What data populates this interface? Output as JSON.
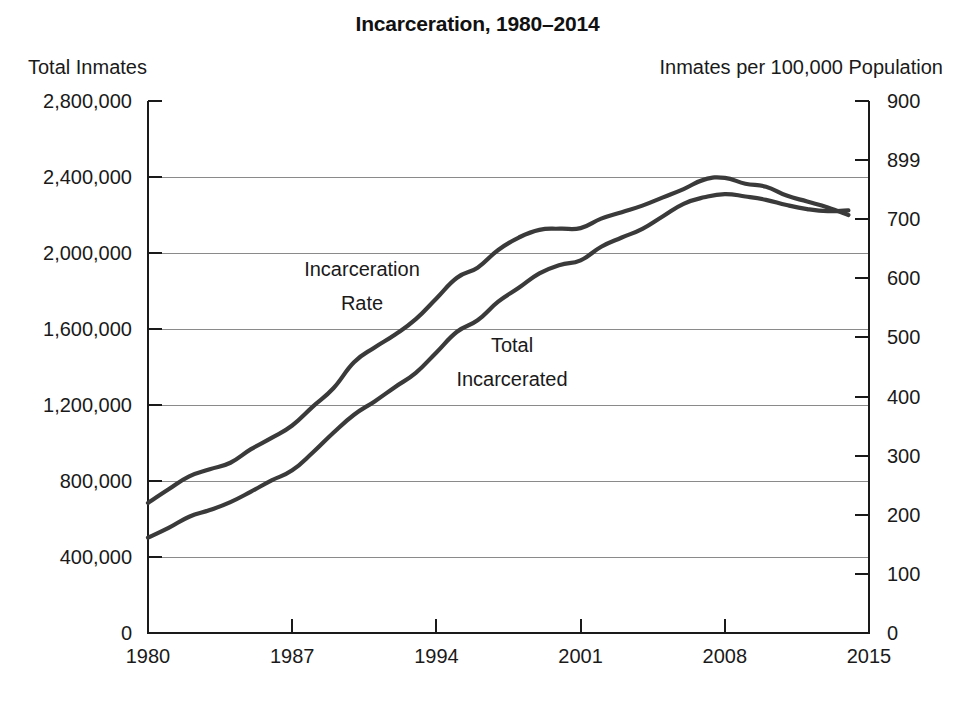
{
  "chart_data": {
    "type": "line",
    "title": "Incarceration, 1980–2014",
    "left_axis_title": "Total Inmates",
    "right_axis_title": "Inmates per 100,000 Population",
    "xlabel": "",
    "grid": true,
    "legend_position": "inline-annotation",
    "x": [
      1980,
      1981,
      1982,
      1983,
      1984,
      1985,
      1986,
      1987,
      1988,
      1989,
      1990,
      1991,
      1992,
      1993,
      1994,
      1995,
      1996,
      1997,
      1998,
      1999,
      2000,
      2001,
      2002,
      2003,
      2004,
      2005,
      2006,
      2007,
      2008,
      2009,
      2010,
      2011,
      2012,
      2013,
      2014
    ],
    "xlim": [
      1980,
      2015
    ],
    "x_tick_labels": [
      "1980",
      "1987",
      "1994",
      "2001",
      "2008",
      "2015"
    ],
    "x_ticks": [
      1980,
      1987,
      1994,
      2001,
      2008,
      2015
    ],
    "left_ylim": [
      0,
      2800000
    ],
    "left_y_ticks": [
      0,
      400000,
      800000,
      1200000,
      1600000,
      2000000,
      2400000,
      2800000
    ],
    "left_y_tick_labels": [
      "0",
      "400,000",
      "800,000",
      "1,200,000",
      "1,600,000",
      "2,000,000",
      "2,400,000",
      "2,800,000"
    ],
    "right_ylim": [
      0,
      900
    ],
    "right_y_ticks": [
      0,
      100,
      200,
      300,
      400,
      500,
      600,
      700,
      800,
      900
    ],
    "right_y_tick_labels": [
      "0",
      "100",
      "200",
      "300",
      "400",
      "500",
      "600",
      "700",
      "899",
      "900"
    ],
    "series": [
      {
        "name": "Incarceration Rate",
        "label": "Incarceration\nRate",
        "label_line1": "Incarceration",
        "label_line2": "Rate",
        "axis": "right",
        "units": "inmates per 100,000 population",
        "color": "#3a3a3a",
        "values": [
          220,
          243,
          265,
          277,
          288,
          311,
          330,
          351,
          383,
          414,
          458,
          483,
          505,
          531,
          566,
          601,
          618,
          648,
          669,
          682,
          684,
          685,
          701,
          712,
          723,
          737,
          751,
          767,
          770,
          760,
          755,
          740,
          730,
          720,
          707
        ]
      },
      {
        "name": "Total Incarcerated",
        "label": "Total\nIncarcerated",
        "label_line1": "Total",
        "label_line2": "Incarcerated",
        "axis": "left",
        "units": "total inmates",
        "color": "#3a3a3a",
        "values": [
          501886,
          553000,
          612000,
          647000,
          689000,
          744208,
          803000,
          856000,
          950000,
          1054000,
          1148702,
          1219014,
          1295150,
          1369185,
          1476621,
          1585586,
          1646020,
          1743643,
          1816931,
          1893115,
          1937482,
          1961247,
          2033022,
          2081580,
          2127100,
          2193798,
          2258792,
          2293157,
          2310300,
          2297400,
          2279800,
          2252400,
          2231300,
          2220300,
          2224400
        ]
      }
    ],
    "annotations": [
      {
        "text": "Incarceration Rate",
        "x": 1991.5,
        "y_left": 1950000
      },
      {
        "text": "Total Incarcerated",
        "x": 1996.0,
        "y_left": 1460000
      }
    ]
  }
}
